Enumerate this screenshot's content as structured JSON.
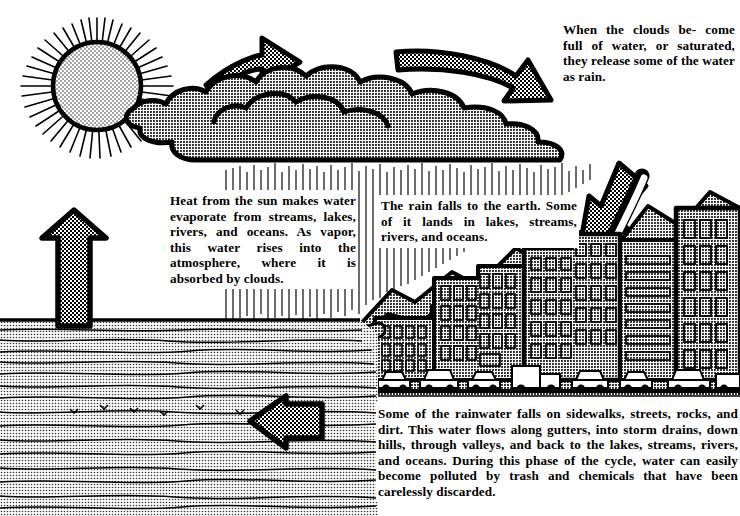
{
  "diagram": {
    "colors": {
      "ink": "#000000",
      "paper": "#ffffff",
      "halftone_grey": "#8a8a8a",
      "light_grey": "#b4b4b4"
    }
  },
  "captions": {
    "clouds": {
      "name": "cloud-saturation-caption",
      "lines": [
        "When the clouds be-",
        "come full of water, or",
        "saturated, they release",
        "some of the water as",
        "rain."
      ],
      "text": "When the clouds become full of water, or saturated, they release some of the water as rain.",
      "emphasis": [
        "saturated"
      ]
    },
    "evaporation": {
      "name": "evaporation-caption",
      "lines": [
        "Heat from the sun makes",
        "water evaporate from",
        "streams, lakes, rivers,",
        "and oceans. As vapor,",
        "this water rises into the",
        "atmosphere, where it is",
        "absorbed by clouds."
      ],
      "text": "Heat from the sun makes water evaporate from streams, lakes, rivers, and oceans. As vapor, this water rises into the atmosphere, where it is absorbed by clouds.",
      "emphasis": [
        "evaporate",
        "vapor"
      ]
    },
    "precipitation": {
      "name": "precipitation-caption",
      "lines": [
        "The rain falls to the earth.",
        "Some of it lands in lakes,",
        "streams, rivers, and oceans."
      ],
      "text": "The rain falls to the earth. Some of it lands in lakes, streams, rivers, and oceans.",
      "emphasis": []
    },
    "runoff": {
      "name": "runoff-caption",
      "lines": [
        "Some of the rainwater falls on sidewalks, streets,",
        "rocks, and dirt. This water flows along gutters, into",
        "storm drains, down hills, through valleys, and back",
        "to the lakes, streams, rivers, and oceans. During this",
        "phase of the cycle, water can easily become polluted",
        "by trash and chemicals that have been carelessly",
        "discarded."
      ],
      "text": "Some of the rainwater falls on sidewalks, streets, rocks, and dirt. This water flows along gutters, into storm drains, down hills, through valleys, and back to the lakes, streams, rivers, and oceans. During this phase of the cycle, water can easily become polluted by trash and chemicals that have been carelessly discarded.",
      "emphasis": []
    }
  },
  "elements": {
    "sun": {
      "label": "sun",
      "ray_count": 46
    },
    "cloud": {
      "label": "cloud"
    },
    "rain": {
      "label": "rain-streaks"
    },
    "ocean": {
      "label": "ocean"
    },
    "mountains": {
      "label": "mountains"
    },
    "city": {
      "label": "city-buildings"
    },
    "cars": {
      "label": "cars"
    },
    "storm_drain": {
      "label": "storm-drain-outflow"
    },
    "arrows": [
      {
        "id": "arrow-evaporation-up",
        "direction": "up",
        "meaning": "water evaporates from the ocean"
      },
      {
        "id": "arrow-sun-to-cloud",
        "direction": "right",
        "meaning": "vapor rises toward the clouds"
      },
      {
        "id": "arrow-cloud-saturates",
        "direction": "right-down",
        "meaning": "clouds become saturated"
      },
      {
        "id": "arrow-rain-down",
        "direction": "down-left",
        "meaning": "rain falls to the earth"
      },
      {
        "id": "arrow-runoff-left",
        "direction": "left",
        "meaning": "runoff returns to the ocean"
      }
    ]
  }
}
